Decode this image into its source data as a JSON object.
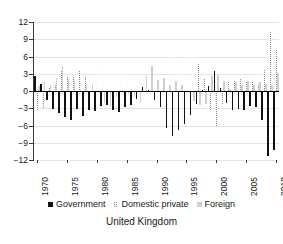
{
  "chart_data": {
    "type": "bar",
    "title": "",
    "subtitle": "",
    "caption": "United Kingdom",
    "xlabel": "",
    "ylabel": "",
    "ylim": [
      -12,
      12
    ],
    "yticks": [
      12,
      9,
      6,
      3,
      0,
      -3,
      -6,
      -9,
      -12
    ],
    "ytick_labels": [
      "12",
      "9",
      "6",
      "3",
      "0",
      "−3",
      "−6",
      "−9",
      "−12"
    ],
    "xticks": [
      1970,
      1975,
      1980,
      1985,
      1990,
      1995,
      2000,
      2005,
      2010
    ],
    "xtick_labels": [
      "1970",
      "1975",
      "1980",
      "1985",
      "1990",
      "1995",
      "2000",
      "2005",
      "2010"
    ],
    "grid": true,
    "grid_axis": "y",
    "legend_position": "bottom",
    "x": [
      1970,
      1971,
      1972,
      1973,
      1974,
      1975,
      1976,
      1977,
      1978,
      1979,
      1980,
      1981,
      1982,
      1983,
      1984,
      1985,
      1986,
      1987,
      1988,
      1989,
      1990,
      1991,
      1992,
      1993,
      1994,
      1995,
      1996,
      1997,
      1998,
      1999,
      2000,
      2001,
      2002,
      2003,
      2004,
      2005,
      2006,
      2007,
      2008,
      2009,
      2010
    ],
    "series": [
      {
        "name": "Government",
        "color": "#111111",
        "pattern": "solid",
        "values": [
          2.6,
          1.3,
          -1.6,
          -3.2,
          -3.8,
          -4.5,
          -5.0,
          -3.2,
          -4.3,
          -3.3,
          -3.4,
          -2.6,
          -2.5,
          -3.3,
          -3.6,
          -2.8,
          -2.4,
          -1.4,
          0.7,
          0.1,
          -1.5,
          -2.8,
          -6.4,
          -7.8,
          -6.8,
          -5.8,
          -4.2,
          -2.2,
          0.1,
          0.9,
          3.4,
          0.5,
          -2.0,
          -3.3,
          -3.2,
          -3.3,
          -2.6,
          -2.7,
          -5.0,
          -11.3,
          -10.2
        ]
      },
      {
        "name": "Domestic private",
        "color": "#8d8d8d",
        "pattern": "dotted",
        "values": [
          -3.5,
          -2.9,
          0.5,
          1.0,
          3.5,
          2.4,
          2.5,
          3.4,
          2.4,
          2.3,
          3.8,
          4.7,
          5.1,
          4.3,
          3.4,
          3.4,
          3.4,
          3.4,
          1.7,
          -0.5,
          -0.4,
          0.5,
          -4.5,
          6.0,
          5.8,
          5.9,
          5.9,
          4.7,
          2.1,
          -3.5,
          -6.1,
          -2.3,
          1.6,
          1.7,
          2.1,
          1.5,
          1.5,
          1.1,
          3.7,
          10.2,
          7.1
        ]
      },
      {
        "name": "Foreign",
        "color": "#cfcfcf",
        "pattern": "solid",
        "values": [
          0.9,
          1.6,
          1.1,
          2.2,
          4.3,
          2.1,
          1.9,
          0.1,
          1.3,
          1.0,
          -0.4,
          -2.1,
          -2.6,
          -1.0,
          0.2,
          -0.6,
          -1.0,
          -2.0,
          2.7,
          4.4,
          1.9,
          2.3,
          1.1,
          1.8,
          1.0,
          -0.1,
          -1.7,
          -2.5,
          -2.2,
          2.6,
          2.7,
          1.8,
          0.4,
          1.6,
          1.1,
          1.8,
          1.1,
          1.6,
          1.3,
          1.1,
          3.1
        ]
      }
    ]
  },
  "legend": {
    "items": [
      {
        "label": "Government"
      },
      {
        "label": "Domestic private"
      },
      {
        "label": "Foreign"
      }
    ]
  },
  "caption": {
    "text": "United Kingdom"
  }
}
